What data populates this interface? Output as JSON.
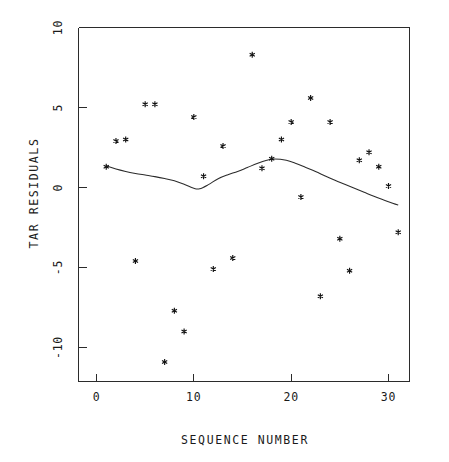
{
  "chart_data": {
    "type": "scatter",
    "title": "",
    "subtitle": "",
    "xlabel": "SEQUENCE NUMBER",
    "ylabel": "TAR RESIDUALS",
    "xlim": [
      -1.8,
      33.5
    ],
    "ylim": [
      -13.1,
      10.6
    ],
    "xticks": [
      0,
      10,
      20,
      30
    ],
    "xtick_labels": [
      "0",
      "10",
      "20",
      "30"
    ],
    "yticks": [
      10,
      5,
      0,
      -5,
      -10
    ],
    "ytick_labels": [
      "10",
      "5",
      "0",
      "-5",
      "-10"
    ],
    "grid": false,
    "legend": false,
    "legend_position": "none",
    "marker_symbol": "asterisk",
    "marker_color": "#111111",
    "line_color": "#2b2b2b",
    "x": [
      1,
      2,
      3,
      4,
      5,
      6,
      7,
      8,
      9,
      10,
      11,
      12,
      13,
      14,
      16,
      17,
      18,
      19,
      20,
      21,
      22,
      23,
      24,
      25,
      26,
      27,
      28,
      29,
      30,
      31
    ],
    "y": [
      1.3,
      2.9,
      3.0,
      -4.6,
      5.2,
      5.2,
      -10.9,
      -7.7,
      -9.0,
      4.4,
      0.7,
      -5.1,
      2.6,
      -4.4,
      8.3,
      1.2,
      1.8,
      3.0,
      4.1,
      -0.6,
      5.6,
      -6.8,
      4.1,
      -3.2,
      -5.2,
      1.7,
      2.2,
      1.3,
      0.1,
      -2.8
    ],
    "series": [
      {
        "name": "TAR residuals",
        "type": "scatter",
        "points": [
          {
            "x": 1,
            "y": 1.3
          },
          {
            "x": 2,
            "y": 2.9
          },
          {
            "x": 3,
            "y": 3.0
          },
          {
            "x": 4,
            "y": -4.6
          },
          {
            "x": 5,
            "y": 5.2
          },
          {
            "x": 6,
            "y": 5.2
          },
          {
            "x": 7,
            "y": -10.9
          },
          {
            "x": 8,
            "y": -7.7
          },
          {
            "x": 9,
            "y": -9.0
          },
          {
            "x": 10,
            "y": 4.4
          },
          {
            "x": 11,
            "y": 0.7
          },
          {
            "x": 12,
            "y": -5.1
          },
          {
            "x": 13,
            "y": 2.6
          },
          {
            "x": 14,
            "y": -4.4
          },
          {
            "x": 16,
            "y": 8.3
          },
          {
            "x": 17,
            "y": 1.2
          },
          {
            "x": 18,
            "y": 1.8
          },
          {
            "x": 19,
            "y": 3.0
          },
          {
            "x": 20,
            "y": 4.1
          },
          {
            "x": 21,
            "y": -0.6
          },
          {
            "x": 22,
            "y": 5.6
          },
          {
            "x": 23,
            "y": -6.8
          },
          {
            "x": 24,
            "y": 4.1
          },
          {
            "x": 25,
            "y": -3.2
          },
          {
            "x": 26,
            "y": -5.2
          },
          {
            "x": 27,
            "y": 1.7
          },
          {
            "x": 28,
            "y": 2.2
          },
          {
            "x": 29,
            "y": 1.3
          },
          {
            "x": 30,
            "y": 0.1
          },
          {
            "x": 31,
            "y": -2.8
          }
        ]
      },
      {
        "name": "smooth fit",
        "type": "line",
        "points": [
          {
            "x": 1.0,
            "y": 1.35
          },
          {
            "x": 2.0,
            "y": 1.15
          },
          {
            "x": 3.0,
            "y": 1.0
          },
          {
            "x": 4.0,
            "y": 0.88
          },
          {
            "x": 5.0,
            "y": 0.78
          },
          {
            "x": 6.0,
            "y": 0.68
          },
          {
            "x": 7.0,
            "y": 0.56
          },
          {
            "x": 8.0,
            "y": 0.42
          },
          {
            "x": 9.0,
            "y": 0.2
          },
          {
            "x": 10.0,
            "y": -0.05
          },
          {
            "x": 10.6,
            "y": -0.08
          },
          {
            "x": 11.5,
            "y": 0.18
          },
          {
            "x": 12.5,
            "y": 0.55
          },
          {
            "x": 13.5,
            "y": 0.8
          },
          {
            "x": 14.5,
            "y": 1.0
          },
          {
            "x": 15.5,
            "y": 1.25
          },
          {
            "x": 16.5,
            "y": 1.5
          },
          {
            "x": 17.5,
            "y": 1.7
          },
          {
            "x": 18.3,
            "y": 1.78
          },
          {
            "x": 19.5,
            "y": 1.7
          },
          {
            "x": 20.5,
            "y": 1.5
          },
          {
            "x": 21.5,
            "y": 1.25
          },
          {
            "x": 22.5,
            "y": 1.0
          },
          {
            "x": 23.5,
            "y": 0.72
          },
          {
            "x": 24.5,
            "y": 0.45
          },
          {
            "x": 25.5,
            "y": 0.2
          },
          {
            "x": 26.5,
            "y": -0.05
          },
          {
            "x": 27.5,
            "y": -0.3
          },
          {
            "x": 28.5,
            "y": -0.55
          },
          {
            "x": 29.5,
            "y": -0.78
          },
          {
            "x": 30.5,
            "y": -1.0
          },
          {
            "x": 31.0,
            "y": -1.1
          }
        ]
      }
    ]
  },
  "axes": {
    "x_label": "SEQUENCE NUMBER",
    "y_label": "TAR RESIDUALS"
  }
}
